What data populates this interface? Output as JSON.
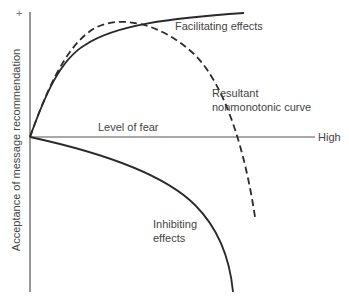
{
  "diagram": {
    "y_axis": {
      "label": "Acceptance of message recommendation",
      "top_marker": "+"
    },
    "x_axis": {
      "label": "Level of fear",
      "end_label": "High"
    },
    "curves": [
      {
        "name": "Facilitating effects",
        "style": "solid",
        "label": "Facilitating effects"
      },
      {
        "name": "Resultant nonmonotonic curve",
        "style": "dashed",
        "label_line1": "Resultant",
        "label_line2": "nonmonotonic curve"
      },
      {
        "name": "Inhibiting effects",
        "style": "solid",
        "label_line1": "Inhibiting",
        "label_line2": "effects"
      }
    ],
    "colors": {
      "line": "#2a2a2a",
      "axis": "#555555",
      "text": "#444444"
    }
  }
}
